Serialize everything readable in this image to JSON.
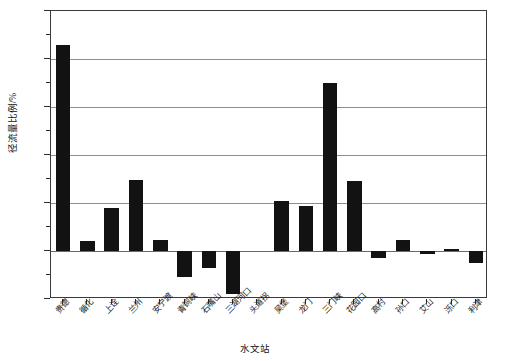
{
  "chart_data": {
    "type": "bar",
    "title": "",
    "xlabel": "水文站",
    "ylabel": "径流量比例/%",
    "ylim": [
      -10,
      50
    ],
    "yticks": [
      -10,
      0,
      10,
      20,
      30,
      40,
      50
    ],
    "ytick_labels": [
      "-10",
      "0",
      "10",
      "20",
      "30",
      "40",
      "50"
    ],
    "yminor_ticks": [
      -5,
      5,
      15,
      25,
      35,
      45
    ],
    "grid": true,
    "grid_axis": "y",
    "legend": null,
    "bar_color": "#121212",
    "categories": [
      "贵德",
      "循化",
      "上诠",
      "兰州",
      "安宁渡",
      "青铜峡",
      "石嘴山",
      "三湖河口",
      "头道拐",
      "吴堡",
      "龙门",
      "三门峡",
      "花园口",
      "高村",
      "孙口",
      "艾山",
      "泺口",
      "利津"
    ],
    "values": [
      43.0,
      2.0,
      9.0,
      14.7,
      2.3,
      -5.5,
      -3.5,
      -9.0,
      0.0,
      10.5,
      9.3,
      35.0,
      14.5,
      -1.5,
      2.3,
      -0.6,
      0.5,
      -2.6
    ]
  }
}
